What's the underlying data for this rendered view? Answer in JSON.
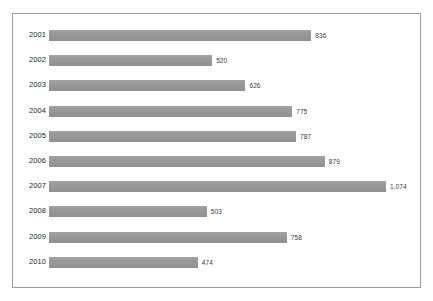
{
  "chart_data": {
    "type": "bar",
    "orientation": "horizontal",
    "title": "",
    "subtitle": "",
    "xlabel": "",
    "ylabel": "",
    "grid": false,
    "legend": false,
    "legend_position": "none",
    "bar_color": "#959595",
    "frame_color": "#9a9a9a",
    "background_color": "#ffffff",
    "label_color": "#1d1d1d",
    "value_label_color": "#3a3a3a",
    "decimal_separator_style": "european-dot-thousands",
    "xlim": [
      0,
      1074
    ],
    "categories": [
      "2001",
      "2002",
      "2003",
      "2004",
      "2005",
      "2006",
      "2007",
      "2008",
      "2009",
      "2010"
    ],
    "values": [
      836,
      520,
      626,
      775,
      787,
      879,
      1074,
      503,
      758,
      474
    ],
    "value_labels": [
      "836",
      "520",
      "626",
      "775",
      "787",
      "879",
      "1.074",
      "503",
      "758",
      "474"
    ],
    "points": [
      {
        "category": "2001",
        "value": 836,
        "label": "836"
      },
      {
        "category": "2002",
        "value": 520,
        "label": "520"
      },
      {
        "category": "2003",
        "value": 626,
        "label": "626"
      },
      {
        "category": "2004",
        "value": 775,
        "label": "775"
      },
      {
        "category": "2005",
        "value": 787,
        "label": "787"
      },
      {
        "category": "2006",
        "value": 879,
        "label": "879"
      },
      {
        "category": "2007",
        "value": 1074,
        "label": "1.074"
      },
      {
        "category": "2008",
        "value": 503,
        "label": "503"
      },
      {
        "category": "2009",
        "value": 758,
        "label": "758"
      },
      {
        "category": "2010",
        "value": 474,
        "label": "474"
      }
    ]
  }
}
